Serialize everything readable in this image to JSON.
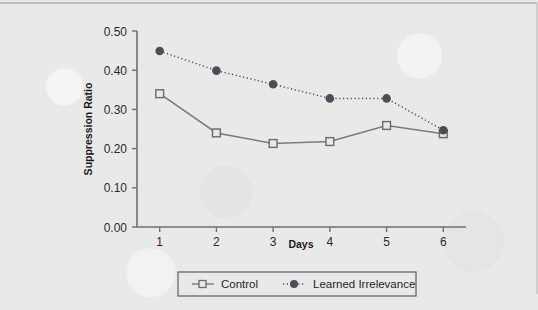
{
  "figure": {
    "background_color": "#e9e9e9",
    "axis_color": "#6f6f6f",
    "control_color": "#7a7a7a",
    "learned_color": "#4d4d58"
  },
  "chart_data": {
    "type": "line",
    "title": "",
    "xlabel": "Days",
    "ylabel": "Suppression Ratio",
    "categories": [
      "1",
      "2",
      "3",
      "4",
      "5",
      "6"
    ],
    "x": [
      1,
      2,
      3,
      4,
      5,
      6
    ],
    "xlim": [
      0.6,
      6.4
    ],
    "ylim": [
      0.0,
      0.5
    ],
    "yticks": [
      "0.00",
      "0.10",
      "0.20",
      "0.30",
      "0.40",
      "0.50"
    ],
    "ytick_values": [
      0.0,
      0.1,
      0.2,
      0.3,
      0.4,
      0.5
    ],
    "xticks": [
      "1",
      "2",
      "3",
      "4",
      "5",
      "6"
    ],
    "grid": false,
    "legend_position": "bottom",
    "series": [
      {
        "name": "Control",
        "marker": "open-square",
        "linestyle": "solid",
        "color": "#7a7a7a",
        "values": [
          0.34,
          0.24,
          0.213,
          0.218,
          0.259,
          0.238
        ]
      },
      {
        "name": "Learned Irrelevance",
        "marker": "filled-circle",
        "linestyle": "dotted",
        "color": "#4d4d58",
        "values": [
          0.449,
          0.399,
          0.364,
          0.328,
          0.328,
          0.247
        ]
      }
    ]
  },
  "legend": {
    "entries": [
      {
        "label": "Control",
        "marker": "open-square-icon"
      },
      {
        "label": "Learned Irrelevance",
        "marker": "filled-circle-icon"
      }
    ]
  }
}
